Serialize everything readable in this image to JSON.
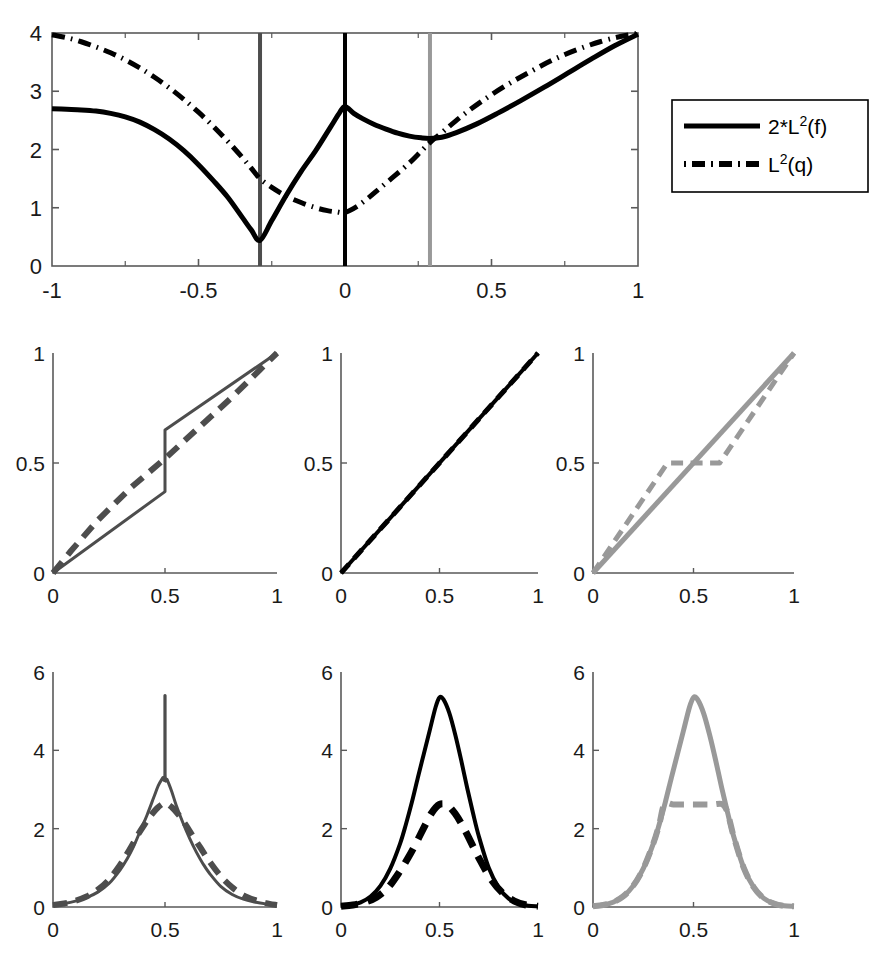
{
  "figure": {
    "title": "",
    "background": "#ffffff",
    "colors": {
      "black": "#000000",
      "dark_gray": "#4d4d4d",
      "light_gray": "#999999",
      "axis": "#5a5a5a"
    }
  },
  "legend": {
    "position": "right-of-top-panel",
    "entries": [
      {
        "label_base": "2*L",
        "label_sup": "2",
        "label_arg": "(f)",
        "style": "solid",
        "color": "#000000"
      },
      {
        "label_base": "L",
        "label_sup": "2",
        "label_arg": "(q)",
        "style": "dashdot",
        "color": "#000000"
      }
    ]
  },
  "chart_data": [
    {
      "id": "top-divergence-panel",
      "type": "line",
      "title": "",
      "xlabel": "",
      "ylabel": "",
      "xlim": [
        -1,
        1
      ],
      "ylim": [
        0,
        4
      ],
      "xticks": [
        -1,
        -0.5,
        0,
        0.5,
        1
      ],
      "xticklabels": [
        "-1",
        "-0.5",
        "0",
        "0.5",
        "1"
      ],
      "xminorticks": [
        -0.75,
        -0.25,
        0.25,
        0.75
      ],
      "yticks": [
        0,
        1,
        2,
        3,
        4
      ],
      "yticklabels": [
        "0",
        "1",
        "2",
        "3",
        "4"
      ],
      "grid": false,
      "box": true,
      "vlines": [
        {
          "x": -0.29,
          "color": "#4d4d4d",
          "width": 4
        },
        {
          "x": 0.0,
          "color": "#000000",
          "width": 4
        },
        {
          "x": 0.29,
          "color": "#999999",
          "width": 4
        }
      ],
      "series": [
        {
          "name": "2*L^2(f)",
          "style": "solid",
          "color": "#000000",
          "width": 5,
          "x": [
            -1.0,
            -0.95,
            -0.9,
            -0.85,
            -0.8,
            -0.75,
            -0.7,
            -0.65,
            -0.6,
            -0.55,
            -0.5,
            -0.45,
            -0.4,
            -0.35,
            -0.32,
            -0.29,
            -0.25,
            -0.2,
            -0.15,
            -0.1,
            -0.05,
            -0.02,
            0.0,
            0.03,
            0.06,
            0.1,
            0.14,
            0.18,
            0.22,
            0.26,
            0.29,
            0.33,
            0.38,
            0.45,
            0.52,
            0.6,
            0.68,
            0.76,
            0.84,
            0.92,
            1.0
          ],
          "y": [
            2.7,
            2.69,
            2.68,
            2.66,
            2.62,
            2.56,
            2.47,
            2.34,
            2.18,
            1.98,
            1.74,
            1.47,
            1.18,
            0.83,
            0.62,
            0.44,
            0.78,
            1.22,
            1.62,
            1.98,
            2.38,
            2.62,
            2.74,
            2.62,
            2.53,
            2.43,
            2.35,
            2.28,
            2.23,
            2.2,
            2.19,
            2.21,
            2.29,
            2.44,
            2.62,
            2.84,
            3.07,
            3.31,
            3.55,
            3.78,
            3.98
          ]
        },
        {
          "name": "L^2(q)",
          "style": "dashdot",
          "color": "#000000",
          "width": 5,
          "x": [
            -1.0,
            -0.95,
            -0.9,
            -0.85,
            -0.8,
            -0.75,
            -0.7,
            -0.65,
            -0.6,
            -0.55,
            -0.5,
            -0.45,
            -0.4,
            -0.35,
            -0.32,
            -0.29,
            -0.25,
            -0.2,
            -0.15,
            -0.1,
            -0.06,
            -0.03,
            0.0,
            0.04,
            0.08,
            0.12,
            0.17,
            0.22,
            0.26,
            0.29,
            0.34,
            0.4,
            0.47,
            0.55,
            0.63,
            0.71,
            0.79,
            0.87,
            0.94,
            1.0
          ],
          "y": [
            3.97,
            3.92,
            3.85,
            3.76,
            3.66,
            3.54,
            3.4,
            3.24,
            3.06,
            2.86,
            2.64,
            2.4,
            2.14,
            1.86,
            1.68,
            1.5,
            1.35,
            1.2,
            1.09,
            1.0,
            0.95,
            0.93,
            0.92,
            1.02,
            1.17,
            1.34,
            1.55,
            1.77,
            1.97,
            2.12,
            2.33,
            2.58,
            2.84,
            3.1,
            3.33,
            3.54,
            3.71,
            3.85,
            3.94,
            3.99
          ]
        }
      ]
    },
    {
      "id": "mid-left-cdf-panel",
      "type": "line",
      "title": "",
      "xlabel": "",
      "ylabel": "",
      "xlim": [
        0,
        1
      ],
      "ylim": [
        0,
        1
      ],
      "xticks": [
        0,
        0.5,
        1
      ],
      "xticklabels": [
        "0",
        "0.5",
        "1"
      ],
      "yticks": [
        0,
        0.5,
        1
      ],
      "yticklabels": [
        "0",
        "0.5",
        "1"
      ],
      "grid": false,
      "box": false,
      "series": [
        {
          "name": "transport-map",
          "style": "solid",
          "color": "#4d4d4d",
          "width": 3,
          "x": [
            0.0,
            0.5,
            0.5,
            1.0
          ],
          "y": [
            0.0,
            0.37,
            0.65,
            1.0
          ]
        },
        {
          "name": "identity-reference",
          "style": "dashed",
          "color": "#4d4d4d",
          "width": 6,
          "x": [
            0.0,
            0.08,
            0.2,
            0.35,
            0.5,
            0.65,
            0.8,
            0.92,
            1.0
          ],
          "y": [
            0.0,
            0.1,
            0.24,
            0.39,
            0.52,
            0.66,
            0.8,
            0.92,
            1.0
          ]
        }
      ]
    },
    {
      "id": "mid-center-cdf-panel",
      "type": "line",
      "title": "",
      "xlabel": "",
      "ylabel": "",
      "xlim": [
        0,
        1
      ],
      "ylim": [
        0,
        1
      ],
      "xticks": [
        0,
        0.5,
        1
      ],
      "xticklabels": [
        "0",
        "0.5",
        "1"
      ],
      "yticks": [
        0,
        0.5,
        1
      ],
      "yticklabels": [
        "0",
        "0.5",
        "1"
      ],
      "grid": false,
      "box": false,
      "series": [
        {
          "name": "transport-map",
          "style": "solid",
          "color": "#000000",
          "width": 4,
          "x": [
            0.0,
            1.0
          ],
          "y": [
            0.0,
            1.0
          ]
        },
        {
          "name": "identity-reference",
          "style": "dashed",
          "color": "#000000",
          "width": 5,
          "x": [
            0.0,
            1.0
          ],
          "y": [
            0.0,
            1.0
          ]
        }
      ]
    },
    {
      "id": "mid-right-cdf-panel",
      "type": "line",
      "title": "",
      "xlabel": "",
      "ylabel": "",
      "xlim": [
        0,
        1
      ],
      "ylim": [
        0,
        1
      ],
      "xticks": [
        0,
        0.5,
        1
      ],
      "xticklabels": [
        "0",
        "0.5",
        "1"
      ],
      "yticks": [
        0,
        0.5,
        1
      ],
      "yticklabels": [
        "0",
        "0.5",
        "1"
      ],
      "grid": false,
      "box": false,
      "series": [
        {
          "name": "transport-map",
          "style": "solid",
          "color": "#999999",
          "width": 5,
          "x": [
            0.0,
            1.0
          ],
          "y": [
            0.0,
            1.0
          ]
        },
        {
          "name": "identity-reference",
          "style": "dashed",
          "color": "#999999",
          "width": 5,
          "x": [
            0.0,
            0.1,
            0.2,
            0.3,
            0.37,
            0.5,
            0.63,
            0.7,
            0.8,
            0.9,
            1.0
          ],
          "y": [
            0.0,
            0.135,
            0.27,
            0.405,
            0.5,
            0.5,
            0.5,
            0.595,
            0.73,
            0.865,
            1.0
          ]
        }
      ]
    },
    {
      "id": "bottom-left-density-panel",
      "type": "line",
      "title": "",
      "xlabel": "",
      "ylabel": "",
      "xlim": [
        0,
        1
      ],
      "ylim": [
        0,
        6
      ],
      "xticks": [
        0,
        0.5,
        1
      ],
      "xticklabels": [
        "0",
        "0.5",
        "1"
      ],
      "yticks": [
        0,
        2,
        4,
        6
      ],
      "yticklabels": [
        "0",
        "2",
        "4",
        "6"
      ],
      "grid": false,
      "box": false,
      "series": [
        {
          "name": "density-f",
          "style": "solid",
          "color": "#4d4d4d",
          "width": 3,
          "x": [
            0.0,
            0.05,
            0.1,
            0.15,
            0.2,
            0.25,
            0.3,
            0.33,
            0.36,
            0.39,
            0.42,
            0.45,
            0.47,
            0.49,
            0.4995,
            0.4995,
            0.5005,
            0.5005,
            0.51,
            0.53,
            0.55,
            0.58,
            0.61,
            0.64,
            0.67,
            0.7,
            0.75,
            0.8,
            0.85,
            0.9,
            0.95,
            1.0
          ],
          "y": [
            0.05,
            0.09,
            0.15,
            0.24,
            0.38,
            0.6,
            0.95,
            1.22,
            1.55,
            1.95,
            2.35,
            2.8,
            3.1,
            3.3,
            3.4,
            5.4,
            5.4,
            3.4,
            3.25,
            2.95,
            2.6,
            2.15,
            1.75,
            1.4,
            1.1,
            0.85,
            0.52,
            0.32,
            0.2,
            0.13,
            0.08,
            0.05
          ]
        },
        {
          "name": "density-q",
          "style": "dashed",
          "color": "#4d4d4d",
          "width": 6,
          "x": [
            0.0,
            0.05,
            0.1,
            0.15,
            0.2,
            0.25,
            0.3,
            0.34,
            0.38,
            0.41,
            0.44,
            0.47,
            0.5,
            0.53,
            0.56,
            0.59,
            0.62,
            0.66,
            0.7,
            0.75,
            0.8,
            0.85,
            0.9,
            0.95,
            1.0
          ],
          "y": [
            0.05,
            0.09,
            0.16,
            0.27,
            0.44,
            0.7,
            1.08,
            1.45,
            1.85,
            2.12,
            2.36,
            2.55,
            2.65,
            2.55,
            2.36,
            2.12,
            1.85,
            1.5,
            1.15,
            0.78,
            0.5,
            0.3,
            0.18,
            0.1,
            0.05
          ]
        }
      ]
    },
    {
      "id": "bottom-center-density-panel",
      "type": "line",
      "title": "",
      "xlabel": "",
      "ylabel": "",
      "xlim": [
        0,
        1
      ],
      "ylim": [
        0,
        6
      ],
      "xticks": [
        0,
        0.5,
        1
      ],
      "xticklabels": [
        "0",
        "0.5",
        "1"
      ],
      "yticks": [
        0,
        2,
        4,
        6
      ],
      "yticklabels": [
        "0",
        "2",
        "4",
        "6"
      ],
      "grid": false,
      "box": false,
      "series": [
        {
          "name": "density-f",
          "style": "solid",
          "color": "#000000",
          "width": 4,
          "x": [
            0.0,
            0.05,
            0.1,
            0.15,
            0.2,
            0.25,
            0.3,
            0.33,
            0.36,
            0.39,
            0.42,
            0.45,
            0.48,
            0.5,
            0.52,
            0.55,
            0.58,
            0.61,
            0.64,
            0.67,
            0.7,
            0.75,
            0.8,
            0.85,
            0.9,
            0.95,
            1.0
          ],
          "y": [
            0.02,
            0.05,
            0.12,
            0.27,
            0.54,
            0.98,
            1.62,
            2.12,
            2.68,
            3.3,
            3.9,
            4.5,
            5.1,
            5.35,
            5.3,
            4.95,
            4.4,
            3.75,
            3.05,
            2.4,
            1.8,
            1.0,
            0.5,
            0.22,
            0.09,
            0.03,
            0.02
          ]
        },
        {
          "name": "density-q",
          "style": "dashed",
          "color": "#000000",
          "width": 7,
          "x": [
            0.0,
            0.06,
            0.12,
            0.18,
            0.24,
            0.3,
            0.34,
            0.38,
            0.42,
            0.46,
            0.5,
            0.54,
            0.58,
            0.62,
            0.66,
            0.7,
            0.76,
            0.82,
            0.88,
            0.94,
            1.0
          ],
          "y": [
            0.02,
            0.05,
            0.12,
            0.25,
            0.5,
            0.92,
            1.25,
            1.62,
            2.02,
            2.4,
            2.62,
            2.6,
            2.38,
            2.05,
            1.65,
            1.25,
            0.72,
            0.36,
            0.15,
            0.05,
            0.02
          ]
        }
      ]
    },
    {
      "id": "bottom-right-density-panel",
      "type": "line",
      "title": "",
      "xlabel": "",
      "ylabel": "",
      "xlim": [
        0,
        1
      ],
      "ylim": [
        0,
        6
      ],
      "xticks": [
        0,
        0.5,
        1
      ],
      "xticklabels": [
        "0",
        "0.5",
        "1"
      ],
      "yticks": [
        0,
        2,
        4,
        6
      ],
      "yticklabels": [
        "0",
        "2",
        "4",
        "6"
      ],
      "grid": false,
      "box": false,
      "series": [
        {
          "name": "density-f",
          "style": "solid",
          "color": "#999999",
          "width": 5,
          "x": [
            0.0,
            0.05,
            0.1,
            0.15,
            0.2,
            0.25,
            0.3,
            0.33,
            0.36,
            0.39,
            0.42,
            0.45,
            0.48,
            0.5,
            0.52,
            0.55,
            0.58,
            0.61,
            0.64,
            0.67,
            0.7,
            0.75,
            0.8,
            0.85,
            0.9,
            0.95,
            1.0
          ],
          "y": [
            0.02,
            0.05,
            0.12,
            0.27,
            0.54,
            0.98,
            1.62,
            2.12,
            2.68,
            3.3,
            3.9,
            4.5,
            5.1,
            5.35,
            5.3,
            4.95,
            4.4,
            3.75,
            3.05,
            2.4,
            1.8,
            1.0,
            0.5,
            0.22,
            0.09,
            0.03,
            0.02
          ]
        },
        {
          "name": "density-q-clipped",
          "style": "dashed",
          "color": "#999999",
          "width": 6,
          "x": [
            0.0,
            0.05,
            0.1,
            0.15,
            0.2,
            0.25,
            0.3,
            0.33,
            0.355,
            0.4,
            0.45,
            0.5,
            0.55,
            0.6,
            0.645,
            0.67,
            0.7,
            0.75,
            0.8,
            0.85,
            0.9,
            0.95,
            1.0
          ],
          "y": [
            0.02,
            0.05,
            0.12,
            0.27,
            0.54,
            0.98,
            1.62,
            2.12,
            2.62,
            2.62,
            2.62,
            2.62,
            2.62,
            2.62,
            2.62,
            2.4,
            1.8,
            1.0,
            0.5,
            0.22,
            0.09,
            0.03,
            0.02
          ]
        }
      ]
    }
  ]
}
